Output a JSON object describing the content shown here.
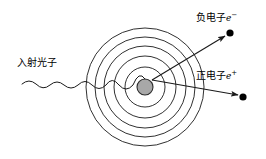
{
  "figure": {
    "background_color": "#ffffff",
    "stroke_color": "#1a1a1a",
    "nucleus_fill": "#a8a8a8",
    "width": 266,
    "height": 159
  },
  "labels": {
    "incident_photon": {
      "text": "入射光子",
      "x": 17,
      "y": 57
    },
    "negative_electron": {
      "text": "负电子",
      "symbol": "e",
      "charge": "−",
      "x": 196,
      "y": 12
    },
    "positron": {
      "text": "正电子",
      "symbol": "e",
      "charge": "+",
      "x": 196,
      "y": 70
    }
  },
  "atom": {
    "center_x": 145,
    "center_y": 87,
    "nucleus_radius": 8,
    "shell_radii": [
      20,
      31,
      41,
      50,
      59
    ],
    "shell_count": 5
  },
  "photon_wave": {
    "start_x": 22,
    "end_x": 152,
    "baseline_y": 86,
    "description": "wavy line increasing in amplitude toward nucleus"
  },
  "particle_tracks": [
    {
      "name": "electron-track",
      "origin_x": 152,
      "origin_y": 80,
      "end_x": 229,
      "end_y": 33,
      "endpoint_dot_radius": 3.6
    },
    {
      "name": "positron-track",
      "origin_x": 152,
      "origin_y": 80,
      "end_x": 243,
      "end_y": 97,
      "endpoint_dot_radius": 3.6
    }
  ]
}
